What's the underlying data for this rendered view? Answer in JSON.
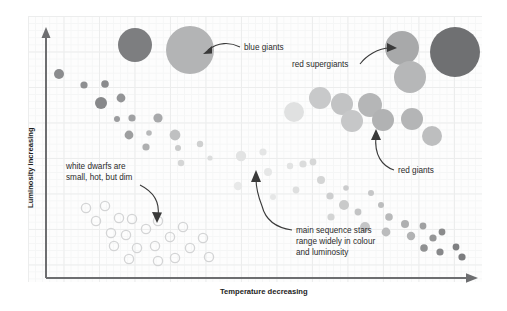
{
  "figure": {
    "background_color": "#ffffff",
    "plot_background_color": "#fdfdfd",
    "grid_minor_color": "#f5f6f6",
    "grid_major_color": "#eceded",
    "axis_color": "#6d6e70",
    "annotation_color": "#2b2b2b",
    "leader_color": "#3a3a3a"
  },
  "axes": {
    "y_label": "Luminosity increasing",
    "x_label": "Temperature decreasing"
  },
  "annotations": [
    {
      "id": "blue-giants",
      "text": "blue giants",
      "lines": [
        "blue giants"
      ]
    },
    {
      "id": "red-supergiants",
      "text": "red supergiants",
      "lines": [
        "red supergiants"
      ]
    },
    {
      "id": "red-giants",
      "text": "red giants",
      "lines": [
        "red giants"
      ]
    },
    {
      "id": "white-dwarfs",
      "text": "white dwarfs are small, hot, but dim",
      "lines": [
        "white dwarfs are",
        "small, hot, but dim"
      ]
    },
    {
      "id": "main-sequence",
      "text": "main sequence stars range widely in colour and luminosity",
      "lines": [
        "main sequence stars",
        "range widely in colour",
        "and luminosity"
      ]
    }
  ],
  "chart_data": {
    "type": "scatter",
    "xlabel": "Temperature decreasing",
    "ylabel": "Luminosity increasing",
    "grid": true,
    "legend": "none",
    "axis_direction": {
      "x": "temperature decreases to the right",
      "y": "luminosity increases upward"
    },
    "note": "Star marker radii in px; colour is greyscale standing in for stellar colour (dark grey = blue/hot, light grey = red/cool).",
    "series": [
      {
        "name": "blue giants",
        "style": "filled",
        "points": [
          {
            "x": 135,
            "y": 45,
            "r": 17,
            "color": "#7d7e80"
          },
          {
            "x": 190,
            "y": 50,
            "r": 24,
            "color": "#b3b4b5"
          }
        ]
      },
      {
        "name": "red supergiants",
        "style": "filled",
        "points": [
          {
            "x": 402,
            "y": 48,
            "r": 17,
            "color": "#a8a9aa"
          },
          {
            "x": 455,
            "y": 52,
            "r": 25,
            "color": "#6f7072"
          },
          {
            "x": 410,
            "y": 77,
            "r": 16,
            "color": "#b6b7b8"
          }
        ]
      },
      {
        "name": "red giants",
        "style": "filled",
        "points": [
          {
            "x": 320,
            "y": 98,
            "r": 11,
            "color": "#c8c9ca"
          },
          {
            "x": 342,
            "y": 104,
            "r": 11,
            "color": "#c2c3c4"
          },
          {
            "x": 370,
            "y": 105,
            "r": 12,
            "color": "#b5b6b7"
          },
          {
            "x": 294,
            "y": 112,
            "r": 10,
            "color": "#e0e1e1"
          },
          {
            "x": 352,
            "y": 121,
            "r": 11,
            "color": "#c6c7c8"
          },
          {
            "x": 383,
            "y": 120,
            "r": 11,
            "color": "#b1b2b3"
          },
          {
            "x": 412,
            "y": 119,
            "r": 11,
            "color": "#b4b5b6"
          },
          {
            "x": 432,
            "y": 136,
            "r": 10,
            "color": "#bdbebf"
          }
        ]
      },
      {
        "name": "main sequence",
        "style": "filled",
        "points": [
          {
            "x": 59,
            "y": 74,
            "r": 5.0,
            "color": "#8b8c8e"
          },
          {
            "x": 84,
            "y": 85,
            "r": 3.6,
            "color": "#8e8f91"
          },
          {
            "x": 105,
            "y": 84,
            "r": 3.8,
            "color": "#8a8b8d"
          },
          {
            "x": 101,
            "y": 103,
            "r": 6.0,
            "color": "#87888a"
          },
          {
            "x": 121,
            "y": 98,
            "r": 4.4,
            "color": "#939496"
          },
          {
            "x": 117,
            "y": 119,
            "r": 3.0,
            "color": "#9b9c9e"
          },
          {
            "x": 132,
            "y": 118,
            "r": 3.6,
            "color": "#a0a1a3"
          },
          {
            "x": 158,
            "y": 118,
            "r": 4.6,
            "color": "#a8a9ab"
          },
          {
            "x": 129,
            "y": 135,
            "r": 4.4,
            "color": "#9d9e9f"
          },
          {
            "x": 149,
            "y": 133,
            "r": 2.8,
            "color": "#b7b8b9"
          },
          {
            "x": 175,
            "y": 135,
            "r": 5.4,
            "color": "#bfc0c1"
          },
          {
            "x": 146,
            "y": 147,
            "r": 3.6,
            "color": "#aeafb0"
          },
          {
            "x": 178,
            "y": 148,
            "r": 3.0,
            "color": "#c9caca"
          },
          {
            "x": 200,
            "y": 144,
            "r": 3.2,
            "color": "#cfd0d0"
          },
          {
            "x": 181,
            "y": 163,
            "r": 3.2,
            "color": "#d5d6d6"
          },
          {
            "x": 210,
            "y": 158,
            "r": 2.6,
            "color": "#dcdddd"
          },
          {
            "x": 241,
            "y": 156,
            "r": 5.2,
            "color": "#e2e3e3"
          },
          {
            "x": 263,
            "y": 152,
            "r": 3.6,
            "color": "#e4e5e5"
          },
          {
            "x": 268,
            "y": 172,
            "r": 4.0,
            "color": "#e6e7e7"
          },
          {
            "x": 290,
            "y": 166,
            "r": 3.2,
            "color": "#e2e3e3"
          },
          {
            "x": 238,
            "y": 186,
            "r": 4.2,
            "color": "#e8e9e9"
          },
          {
            "x": 303,
            "y": 164,
            "r": 3.6,
            "color": "#dbdcdc"
          },
          {
            "x": 313,
            "y": 162,
            "r": 3.4,
            "color": "#d6d7d7"
          },
          {
            "x": 321,
            "y": 180,
            "r": 4.0,
            "color": "#d4d5d5"
          },
          {
            "x": 296,
            "y": 190,
            "r": 3.4,
            "color": "#dedfdf"
          },
          {
            "x": 273,
            "y": 197,
            "r": 3.0,
            "color": "#e6e7e7"
          },
          {
            "x": 330,
            "y": 196,
            "r": 3.6,
            "color": "#cdcecf"
          },
          {
            "x": 346,
            "y": 188,
            "r": 2.8,
            "color": "#cbcccd"
          },
          {
            "x": 371,
            "y": 193,
            "r": 3.0,
            "color": "#c6c7c8"
          },
          {
            "x": 344,
            "y": 205,
            "r": 5.0,
            "color": "#c9caca"
          },
          {
            "x": 358,
            "y": 212,
            "r": 3.4,
            "color": "#c3c4c5"
          },
          {
            "x": 331,
            "y": 217,
            "r": 3.6,
            "color": "#d3d4d4"
          },
          {
            "x": 381,
            "y": 205,
            "r": 3.0,
            "color": "#bcbdbe"
          },
          {
            "x": 389,
            "y": 217,
            "r": 3.8,
            "color": "#b8b9ba"
          },
          {
            "x": 365,
            "y": 227,
            "r": 5.0,
            "color": "#c4c5c6"
          },
          {
            "x": 386,
            "y": 232,
            "r": 4.4,
            "color": "#bbbcbd"
          },
          {
            "x": 405,
            "y": 224,
            "r": 4.0,
            "color": "#aeafb0"
          },
          {
            "x": 411,
            "y": 236,
            "r": 4.2,
            "color": "#b2b3b4"
          },
          {
            "x": 423,
            "y": 226,
            "r": 3.4,
            "color": "#a0a1a2"
          },
          {
            "x": 433,
            "y": 238,
            "r": 3.6,
            "color": "#959697"
          },
          {
            "x": 442,
            "y": 232,
            "r": 3.4,
            "color": "#8a8b8c"
          },
          {
            "x": 424,
            "y": 248,
            "r": 3.8,
            "color": "#909192"
          },
          {
            "x": 440,
            "y": 252,
            "r": 3.6,
            "color": "#87888a"
          },
          {
            "x": 456,
            "y": 247,
            "r": 3.4,
            "color": "#7f8082"
          },
          {
            "x": 462,
            "y": 257,
            "r": 3.6,
            "color": "#7b7c7e"
          },
          {
            "x": 448,
            "y": 259,
            "r": 3.0,
            "color": "#85868800"
          }
        ]
      },
      {
        "name": "white dwarfs",
        "style": "outlined",
        "stroke_color": "#d3d4d5",
        "points": [
          {
            "x": 86,
            "y": 208,
            "r": 4.6
          },
          {
            "x": 105,
            "y": 206,
            "r": 4.6
          },
          {
            "x": 96,
            "y": 221,
            "r": 4.6
          },
          {
            "x": 119,
            "y": 218,
            "r": 4.6
          },
          {
            "x": 132,
            "y": 219,
            "r": 4.6
          },
          {
            "x": 111,
            "y": 233,
            "r": 4.6
          },
          {
            "x": 126,
            "y": 235,
            "r": 4.6
          },
          {
            "x": 146,
            "y": 229,
            "r": 4.6
          },
          {
            "x": 158,
            "y": 221,
            "r": 4.6
          },
          {
            "x": 114,
            "y": 246,
            "r": 4.6
          },
          {
            "x": 137,
            "y": 248,
            "r": 4.6
          },
          {
            "x": 155,
            "y": 246,
            "r": 4.6
          },
          {
            "x": 170,
            "y": 237,
            "r": 4.6
          },
          {
            "x": 183,
            "y": 227,
            "r": 4.6
          },
          {
            "x": 129,
            "y": 259,
            "r": 4.6
          },
          {
            "x": 158,
            "y": 261,
            "r": 4.6
          },
          {
            "x": 175,
            "y": 258,
            "r": 4.6
          },
          {
            "x": 190,
            "y": 248,
            "r": 4.6
          },
          {
            "x": 203,
            "y": 238,
            "r": 4.6
          },
          {
            "x": 209,
            "y": 257,
            "r": 4.6
          }
        ]
      }
    ]
  }
}
